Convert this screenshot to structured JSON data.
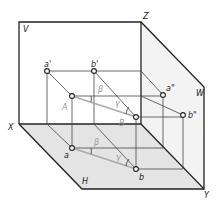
{
  "diagram": {
    "planes": {
      "V": "V",
      "W": "W",
      "H": "H"
    },
    "axes": {
      "X": "X",
      "Y": "Y",
      "Z": "Z"
    },
    "points": {
      "a_prime": "a'",
      "b_prime": "b'",
      "a_dprime": "a\"",
      "b_dprime": "b\"",
      "a": "a",
      "b": "b",
      "A": "A",
      "B": "B"
    },
    "angles": {
      "beta_v": "β",
      "gamma_v": "γ",
      "beta_h": "β",
      "gamma_h": "γ"
    },
    "colors": {
      "frame": "#222222",
      "plane_h": "#e6e6e6",
      "plane_w": "#f2f2f2",
      "thin": "#555555",
      "line_ab": "#b0b0b0"
    }
  }
}
